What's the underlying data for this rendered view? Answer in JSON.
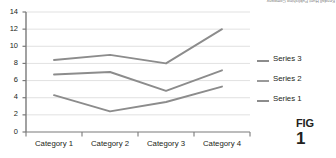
{
  "chart_data": {
    "type": "line",
    "title": "",
    "xlabel": "",
    "ylabel": "",
    "categories": [
      "Category 1",
      "Category 2",
      "Category 3",
      "Category 4"
    ],
    "series": [
      {
        "name": "Series 1",
        "values": [
          4.3,
          2.4,
          3.5,
          5.3
        ],
        "color": "#8c8c8c"
      },
      {
        "name": "Series 2",
        "values": [
          6.7,
          7.0,
          4.8,
          7.2
        ],
        "color": "#8c8c8c"
      },
      {
        "name": "Series 3",
        "values": [
          8.4,
          9.0,
          8.0,
          12.0
        ],
        "color": "#8c8c8c"
      }
    ],
    "ylim": [
      0,
      14
    ],
    "yticks": [
      "0",
      "2",
      "4",
      "6",
      "8",
      "10",
      "12",
      "14"
    ],
    "ytick_values": [
      0,
      2,
      4,
      6,
      8,
      10,
      12,
      14
    ],
    "grid": true,
    "grid_color": "#d9d9d9",
    "axis_color": "#7a7a7a",
    "legend_position": "right",
    "legend_entries": [
      "Series 3",
      "Series 2",
      "Series 1"
    ]
  },
  "legend": {
    "rows": [
      {
        "label": "Series 3",
        "color": "#8c8c8c"
      },
      {
        "label": "Series 2",
        "color": "#9a9a9a"
      },
      {
        "label": "Series 1",
        "color": "#8c8c8c"
      }
    ]
  },
  "credit": {
    "text": "Kendall Hunt Publishing Company"
  },
  "caption": {
    "fig_label": "FIG",
    "number": "1"
  }
}
